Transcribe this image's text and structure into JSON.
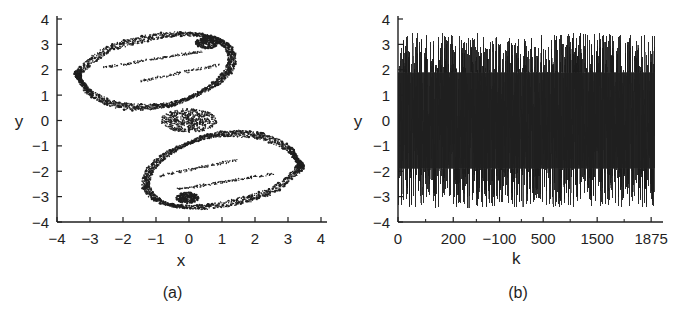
{
  "figure": {
    "background_color": "#ffffff",
    "ink_color": "#1f1f1f"
  },
  "panels": [
    {
      "id": "a",
      "caption": "(a)"
    },
    {
      "id": "b",
      "caption": "(b)"
    }
  ],
  "panel_a": {
    "caption": "(a)",
    "xlabel": "x",
    "ylabel": "y",
    "xticks": [
      "-4",
      "-3",
      "-2",
      "-1",
      "0",
      "1",
      "2",
      "3",
      "4"
    ],
    "yticks": [
      "4",
      "3",
      "2",
      "1",
      "0",
      "-1",
      "-2",
      "-3",
      "-4"
    ]
  },
  "panel_b": {
    "caption": "(b)",
    "xlabel": "k",
    "ylabel": "y",
    "xticks": [
      "0",
      "200",
      "-100",
      "500",
      "1500",
      "1875"
    ],
    "yticks": [
      "4",
      "3",
      "2",
      "1",
      "0",
      "-1",
      "-2",
      "-3",
      "-4"
    ]
  },
  "chart_data": [
    {
      "type": "scatter",
      "panel": "a",
      "title": "",
      "xlabel": "x",
      "ylabel": "y",
      "xlim": [
        -4,
        4
      ],
      "ylim": [
        -4,
        4
      ],
      "xticks": [
        -4,
        -3,
        -2,
        -1,
        0,
        1,
        2,
        3,
        4
      ],
      "yticks": [
        -4,
        -3,
        -2,
        -1,
        0,
        1,
        2,
        3,
        4
      ],
      "grid": false,
      "legend": null,
      "description": "Phase portrait of a chaotic attractor with a double-lobe (figure-eight / butterfly) structure; dense speckled orbit bands form two hollow rings crossing near the origin.",
      "marker": "point",
      "marker_color": "#1a1a1a",
      "upper_lobe": {
        "x_range": [
          -3.35,
          1.35
        ],
        "y_range": [
          0.45,
          3.45
        ],
        "outline_x": [
          -3.3,
          -2.6,
          -1.6,
          -0.5,
          0.45,
          1.05,
          1.3,
          1.2,
          0.8,
          0.1,
          -0.6,
          -1.4,
          -2.2,
          -2.95,
          -3.25,
          -3.35,
          -3.3
        ],
        "outline_y": [
          1.95,
          2.7,
          3.15,
          3.4,
          3.35,
          3.05,
          2.55,
          2.0,
          1.45,
          0.95,
          0.62,
          0.52,
          0.62,
          1.05,
          1.5,
          1.75,
          1.95
        ]
      },
      "lower_lobe": {
        "x_range": [
          -1.35,
          3.4
        ],
        "y_range": [
          -3.45,
          -0.45
        ],
        "outline_x": [
          3.3,
          2.6,
          1.6,
          0.5,
          -0.45,
          -1.05,
          -1.3,
          -1.2,
          -0.8,
          -0.1,
          0.6,
          1.4,
          2.2,
          2.95,
          3.25,
          3.38,
          3.3
        ],
        "outline_y": [
          -1.95,
          -2.7,
          -3.15,
          -3.4,
          -3.35,
          -3.05,
          -2.55,
          -2.0,
          -1.45,
          -0.95,
          -0.62,
          -0.52,
          -0.62,
          -1.05,
          -1.5,
          -1.75,
          -1.95
        ]
      },
      "crossing_point": [
        0.0,
        0.0
      ],
      "dense_clusters": [
        {
          "x": -0.05,
          "y": -3.05,
          "note": "dark blob on lower lobe"
        },
        {
          "x": 0.55,
          "y": 3.05,
          "note": "dark blob on upper lobe"
        }
      ]
    },
    {
      "type": "line",
      "panel": "b",
      "title": "",
      "xlabel": "k",
      "ylabel": "y",
      "xlim": [
        0,
        1875
      ],
      "ylim": [
        -4,
        4
      ],
      "xticks": [
        0,
        200,
        -100,
        500,
        1500,
        1875
      ],
      "xtick_labels": [
        "0",
        "200",
        "-100",
        "500",
        "1500",
        "1875"
      ],
      "yticks": [
        -4,
        -3,
        -2,
        -1,
        0,
        1,
        2,
        3,
        4
      ],
      "grid": false,
      "legend": null,
      "description": "Time series of y versus iteration index k showing sustained chaotic oscillation; the trace is so dense it fills a solid band roughly between y = -3.5 and y = +3.5, with sparse spikes reaching the extremes.",
      "line_color": "#1a1a1a",
      "line_width": 0.6,
      "envelope_upper": 3.45,
      "envelope_lower": -3.45,
      "dense_band": [
        -1.9,
        1.9
      ],
      "n_points": 1875
    }
  ]
}
